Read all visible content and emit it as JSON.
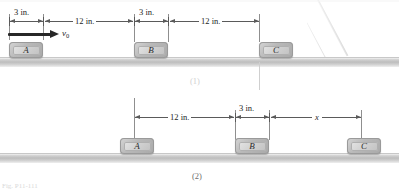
{
  "figure": {
    "colors": {
      "background": "#ffffff",
      "ground": "#bdbdbd",
      "block_fill": "#cfcfcf",
      "dimension_line": "#5a5a5a",
      "extension_line": "#8f8f8f",
      "velocity_arrow": "#272727",
      "caption": "#6e6e6e"
    }
  },
  "panel1": {
    "caption": "(1)",
    "blocks": [
      {
        "label": "A"
      },
      {
        "label": "B"
      },
      {
        "label": "C"
      }
    ],
    "dimensions": [
      {
        "label": "3 in.",
        "value": 3,
        "unit": "in.",
        "from": "A-left",
        "to": "A-right"
      },
      {
        "label": "12 in.",
        "value": 12,
        "unit": "in.",
        "from": "A-right",
        "to": "B-left"
      },
      {
        "label": "3 in.",
        "value": 3,
        "unit": "in.",
        "from": "B-left",
        "to": "B-right"
      },
      {
        "label": "12 in.",
        "value": 12,
        "unit": "in.",
        "from": "B-right",
        "to": "C-left"
      }
    ],
    "velocity": {
      "symbol": "v",
      "subscript": "0",
      "direction": "right"
    }
  },
  "panel2": {
    "caption": "(2)",
    "blocks": [
      {
        "label": "A"
      },
      {
        "label": "B"
      },
      {
        "label": "C"
      }
    ],
    "dimensions": [
      {
        "label": "12 in.",
        "value": 12,
        "unit": "in.",
        "from": "A",
        "to": "B-left"
      },
      {
        "label": "3 in.",
        "value": 3,
        "unit": "in.",
        "from": "B-left",
        "to": "B-right"
      },
      {
        "label": "x",
        "value": null,
        "unit": "",
        "from": "B-right",
        "to": "C"
      }
    ]
  },
  "artifacts": {
    "cropped_caption": "Fig. P11-111"
  }
}
